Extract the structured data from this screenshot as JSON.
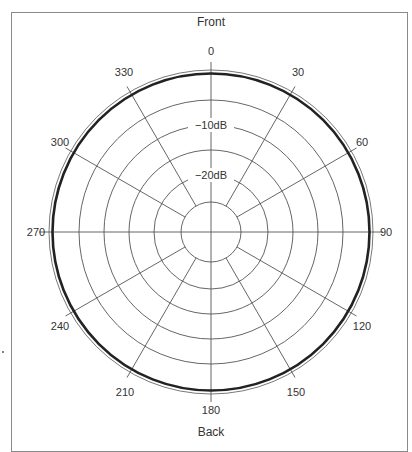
{
  "diagram": {
    "type": "polar-pickup-pattern",
    "front_label": "Front",
    "back_label": "Back",
    "angle_labels": [
      "0",
      "30",
      "60",
      "90",
      "120",
      "150",
      "180",
      "210",
      "240",
      "270",
      "300",
      "330"
    ],
    "level_labels": [
      "−10dB",
      "−20dB"
    ],
    "pattern": "omnidirectional",
    "colors": {
      "grid": "#555555",
      "pattern": "#222222",
      "frame": "#8a8a8a",
      "text": "#333333"
    }
  },
  "chart_data": {
    "type": "polar",
    "title": "",
    "top_label": "Front",
    "bottom_label": "Back",
    "angle_ticks_deg": [
      0,
      30,
      60,
      90,
      120,
      150,
      180,
      210,
      240,
      270,
      300,
      330
    ],
    "radial_labels": [
      "−10dB",
      "−20dB"
    ],
    "series": [
      {
        "name": "pickup pattern",
        "shape": "circle",
        "level_db": 0,
        "theta": [
          0,
          30,
          60,
          90,
          120,
          150,
          180,
          210,
          240,
          270,
          300,
          330
        ],
        "r_db": [
          0,
          0,
          0,
          0,
          0,
          0,
          0,
          0,
          0,
          0,
          0,
          0
        ]
      }
    ],
    "grid": true
  }
}
